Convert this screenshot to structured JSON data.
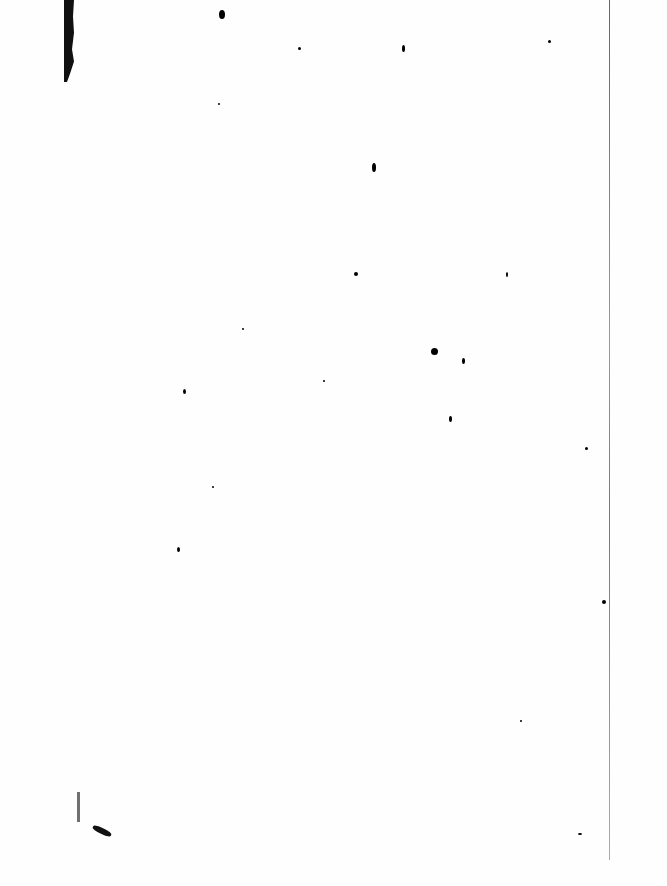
{
  "document": {
    "type": "blank scanned page",
    "text": ""
  },
  "colors": {
    "paper": "#fefefe",
    "ink": "#000000"
  }
}
